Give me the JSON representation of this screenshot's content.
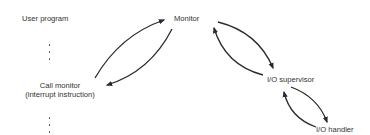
{
  "diagram": {
    "nodes": {
      "user_program": "User program",
      "monitor": "Monitor",
      "call_monitor_line1": "Call monitor",
      "call_monitor_line2": "(interrupt instruction)",
      "io_supervisor": "I/O supervisor",
      "io_handler": "I/O handler"
    },
    "ellipsis_upper": ":",
    "ellipsis_lower": ":",
    "edges": [
      {
        "from": "Call monitor",
        "to": "Monitor"
      },
      {
        "from": "Monitor",
        "to": "Call monitor"
      },
      {
        "from": "Monitor",
        "to": "I/O supervisor"
      },
      {
        "from": "I/O supervisor",
        "to": "Monitor"
      },
      {
        "from": "I/O supervisor",
        "to": "I/O handler"
      },
      {
        "from": "I/O handler",
        "to": "I/O supervisor"
      }
    ],
    "colors": {
      "line": "#2a2a2a",
      "text": "#333333",
      "background": "#ffffff"
    }
  }
}
